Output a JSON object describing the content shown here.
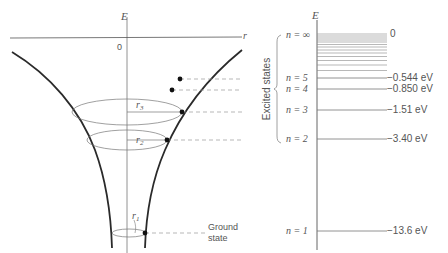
{
  "left_diagram": {
    "axis_vertical_label": "E",
    "axis_horizontal_label": "r",
    "origin_label": "0",
    "radius_labels": {
      "r1": "r",
      "r1_sub": "1",
      "r2": "r",
      "r2_sub": "2",
      "r3": "r",
      "r3_sub": "3"
    },
    "ground_state_line1": "Ground",
    "ground_state_line2": "state"
  },
  "right_diagram": {
    "axis_label": "E",
    "bracket_label": "Excited states",
    "levels": [
      {
        "n_label": "n = ∞",
        "energy": "0"
      },
      {
        "n_label": "n = 5",
        "energy": "−0.544 eV"
      },
      {
        "n_label": "n = 4",
        "energy": "−0.850 eV"
      },
      {
        "n_label": "n = 3",
        "energy": "−1.51 eV"
      },
      {
        "n_label": "n = 2",
        "energy": "−3.40 eV"
      },
      {
        "n_label": "n = 1",
        "energy": "−13.6 eV"
      }
    ]
  },
  "colors": {
    "curve": "#2a2a2a",
    "thin": "#777777",
    "text": "#555555",
    "dashed": "#999999"
  }
}
